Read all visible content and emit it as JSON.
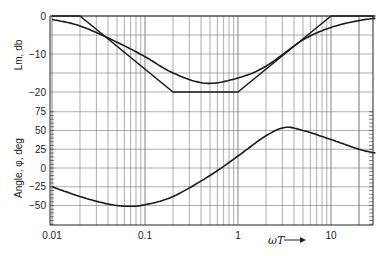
{
  "chart_data": [
    {
      "type": "line",
      "title": "",
      "xlabel": "ωT",
      "ylabel": "Lm, db",
      "xscale": "log",
      "xlim": [
        0.01,
        30
      ],
      "ylim": [
        -25,
        0
      ],
      "x_ticks": [
        "0.01",
        "0.1",
        "1",
        "10"
      ],
      "y_ticks": [
        "0",
        "-10",
        "-20"
      ],
      "grid": true,
      "series": [
        {
          "name": "Asymptotic Lm",
          "x": [
            0.01,
            0.02,
            0.2,
            1,
            10,
            30
          ],
          "y": [
            0,
            0,
            -20,
            -20,
            0,
            0
          ]
        },
        {
          "name": "Exact Lm",
          "x": [
            0.01,
            0.02,
            0.05,
            0.1,
            0.2,
            0.45,
            1,
            2,
            5,
            10,
            20,
            30
          ],
          "y": [
            -0.9,
            -2.6,
            -6.9,
            -10.7,
            -15.0,
            -17.7,
            -16.3,
            -13.2,
            -6.3,
            -3.0,
            -1.2,
            -0.6
          ]
        }
      ]
    },
    {
      "type": "line",
      "title": "",
      "xlabel": "ωT",
      "ylabel": "Angle, φ, deg",
      "xscale": "log",
      "xlim": [
        0.01,
        30
      ],
      "ylim": [
        -75,
        75
      ],
      "x_ticks": [
        "0.01",
        "0.1",
        "1",
        "10"
      ],
      "y_ticks": [
        "75",
        "50",
        "25",
        "0",
        "-25",
        "-50"
      ],
      "grid": true,
      "series": [
        {
          "name": "Phase angle",
          "x": [
            0.01,
            0.02,
            0.04,
            0.065,
            0.1,
            0.2,
            0.5,
            1,
            2,
            3.2,
            5,
            10,
            20,
            30
          ],
          "y": [
            -25,
            -38,
            -48,
            -51,
            -49,
            -38,
            -10,
            16,
            43,
            54,
            50,
            38,
            25,
            20
          ]
        }
      ]
    }
  ],
  "labels": {
    "lm_axis": "Lm, db",
    "angle_axis": "Angle, φ, deg",
    "x_axis": "ωT",
    "arrow": "⟶"
  }
}
